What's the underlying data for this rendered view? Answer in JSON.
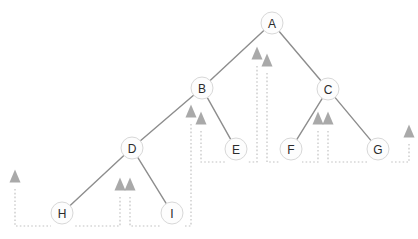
{
  "diagram": {
    "type": "binary-tree-with-traversal-pointers",
    "background_color": "#ffffff",
    "node_fill_color": "#fdfdfd",
    "node_stroke_color": "#d8d8d8",
    "edge_color": "#8d8d8d",
    "dotted_color": "#c2c2c2",
    "marker_color": "#a9a9a9",
    "nodes": [
      {
        "id": "A",
        "label": "A",
        "x": 272,
        "y": 23,
        "r": 11
      },
      {
        "id": "B",
        "label": "B",
        "x": 202,
        "y": 88,
        "r": 11
      },
      {
        "id": "C",
        "label": "C",
        "x": 328,
        "y": 89,
        "r": 11
      },
      {
        "id": "D",
        "label": "D",
        "x": 132,
        "y": 148,
        "r": 11
      },
      {
        "id": "E",
        "label": "E",
        "x": 236,
        "y": 149,
        "r": 11
      },
      {
        "id": "F",
        "label": "F",
        "x": 291,
        "y": 149,
        "r": 11
      },
      {
        "id": "G",
        "label": "G",
        "x": 378,
        "y": 149,
        "r": 11
      },
      {
        "id": "H",
        "label": "H",
        "x": 62,
        "y": 213,
        "r": 11
      },
      {
        "id": "I",
        "label": "I",
        "x": 172,
        "y": 213,
        "r": 11
      }
    ],
    "edges": [
      {
        "from": "A",
        "to": "B"
      },
      {
        "from": "A",
        "to": "C"
      },
      {
        "from": "B",
        "to": "D"
      },
      {
        "from": "B",
        "to": "E"
      },
      {
        "from": "C",
        "to": "F"
      },
      {
        "from": "C",
        "to": "G"
      },
      {
        "from": "D",
        "to": "H"
      },
      {
        "from": "D",
        "to": "I"
      }
    ],
    "markers": [
      {
        "id": "marker-left-of-h",
        "x": 15,
        "y": 176,
        "w": 11,
        "h": 13
      },
      {
        "id": "marker-d-left",
        "x": 120,
        "y": 184,
        "w": 11,
        "h": 13
      },
      {
        "id": "marker-d-right",
        "x": 130,
        "y": 184,
        "w": 11,
        "h": 13
      },
      {
        "id": "marker-b-left",
        "x": 191,
        "y": 111,
        "w": 11,
        "h": 13
      },
      {
        "id": "marker-b-right",
        "x": 201,
        "y": 118,
        "w": 11,
        "h": 13
      },
      {
        "id": "marker-a-left",
        "x": 257,
        "y": 53,
        "w": 11,
        "h": 13
      },
      {
        "id": "marker-a-right",
        "x": 267,
        "y": 60,
        "w": 11,
        "h": 13
      },
      {
        "id": "marker-c-left",
        "x": 318,
        "y": 118,
        "w": 11,
        "h": 13
      },
      {
        "id": "marker-c-right",
        "x": 328,
        "y": 118,
        "w": 11,
        "h": 13
      },
      {
        "id": "marker-right-of-g",
        "x": 409,
        "y": 131,
        "w": 11,
        "h": 13
      }
    ],
    "dotted_paths": [
      {
        "id": "path-left-of-h",
        "d": "M 15 189 L 15 226 L 51 226"
      },
      {
        "id": "path-h-to-d-left",
        "d": "M 120 197 L 120 226 L 73 226"
      },
      {
        "id": "path-i-to-d-right",
        "d": "M 130 197 L 130 226 L 161 226"
      },
      {
        "id": "path-i-up-to-b",
        "d": "M 191 124 L 191 226 L 183 226"
      },
      {
        "id": "path-e-to-b",
        "d": "M 201 131 L 201 162 L 225 162"
      },
      {
        "id": "path-e-up-to-a",
        "d": "M 257 66 L 257 162 L 247 162"
      },
      {
        "id": "path-f-up-to-a",
        "d": "M 267 73 L 267 162 L 280 162"
      },
      {
        "id": "path-f-to-c",
        "d": "M 318 131 L 318 162 L 302 162"
      },
      {
        "id": "path-g-to-c",
        "d": "M 328 131 L 328 162 L 367 162"
      },
      {
        "id": "path-right-of-g",
        "d": "M 409 144 L 409 162 L 389 162"
      }
    ]
  }
}
